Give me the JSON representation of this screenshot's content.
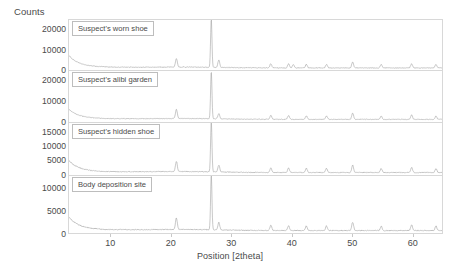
{
  "chart_data": {
    "type": "line",
    "title": "",
    "subtitle": "",
    "xlabel": "Position [2theta]",
    "ylabel": "Counts",
    "xlim": [
      3,
      65
    ],
    "grid": false,
    "legend_position": "in-panel-box",
    "xticks": [
      10,
      20,
      30,
      40,
      50,
      60
    ],
    "xtick_labels": [
      "10",
      "20",
      "30",
      "40",
      "50",
      "60"
    ],
    "panels": [
      {
        "label": "Suspect's worn shoe",
        "ylim": [
          0,
          25000
        ],
        "yticks": [
          0,
          10000,
          20000
        ],
        "ytick_labels": [
          "0",
          "10000",
          "20000"
        ],
        "peaks": [
          {
            "x": 20.85,
            "y": 4200
          },
          {
            "x": 26.65,
            "y": 24000
          },
          {
            "x": 27.9,
            "y": 3600
          },
          {
            "x": 36.55,
            "y": 2100
          },
          {
            "x": 39.5,
            "y": 2000
          },
          {
            "x": 40.3,
            "y": 1700
          },
          {
            "x": 42.45,
            "y": 1800
          },
          {
            "x": 45.8,
            "y": 1800
          },
          {
            "x": 50.15,
            "y": 3000
          },
          {
            "x": 54.9,
            "y": 1700
          },
          {
            "x": 59.95,
            "y": 2100
          },
          {
            "x": 64.0,
            "y": 1700
          }
        ],
        "baseline": 1100,
        "low_angle_rise": 5200
      },
      {
        "label": "Suspect's alibi garden",
        "ylim": [
          0,
          25000
        ],
        "yticks": [
          0,
          10000,
          20000
        ],
        "ytick_labels": [
          "0",
          "10000",
          "20000"
        ],
        "peaks": [
          {
            "x": 20.85,
            "y": 4500
          },
          {
            "x": 26.65,
            "y": 23500
          },
          {
            "x": 27.9,
            "y": 2600
          },
          {
            "x": 36.55,
            "y": 2000
          },
          {
            "x": 39.5,
            "y": 1900
          },
          {
            "x": 42.45,
            "y": 1700
          },
          {
            "x": 45.8,
            "y": 1700
          },
          {
            "x": 50.15,
            "y": 3200
          },
          {
            "x": 54.9,
            "y": 1600
          },
          {
            "x": 59.95,
            "y": 2200
          },
          {
            "x": 64.0,
            "y": 1600
          }
        ],
        "baseline": 1000,
        "low_angle_rise": 4200
      },
      {
        "label": "Suspect's hidden shoe",
        "ylim": [
          0,
          18500
        ],
        "yticks": [
          0,
          5000,
          10000,
          15000
        ],
        "ytick_labels": [
          "0",
          "5000",
          "10000",
          "15000"
        ],
        "peaks": [
          {
            "x": 20.85,
            "y": 3600
          },
          {
            "x": 26.65,
            "y": 17800
          },
          {
            "x": 27.9,
            "y": 2400
          },
          {
            "x": 36.55,
            "y": 1700
          },
          {
            "x": 39.5,
            "y": 1600
          },
          {
            "x": 42.45,
            "y": 1500
          },
          {
            "x": 45.8,
            "y": 1500
          },
          {
            "x": 50.15,
            "y": 2600
          },
          {
            "x": 54.9,
            "y": 1400
          },
          {
            "x": 59.95,
            "y": 1800
          },
          {
            "x": 64.0,
            "y": 1400
          }
        ],
        "baseline": 900,
        "low_angle_rise": 3600
      },
      {
        "label": "Body deposition site",
        "ylim": [
          0,
          13000
        ],
        "yticks": [
          0,
          5000,
          10000
        ],
        "ytick_labels": [
          "0",
          "5000",
          "10000"
        ],
        "peaks": [
          {
            "x": 20.85,
            "y": 2600
          },
          {
            "x": 26.65,
            "y": 12500
          },
          {
            "x": 27.9,
            "y": 1700
          },
          {
            "x": 36.55,
            "y": 1200
          },
          {
            "x": 39.5,
            "y": 1100
          },
          {
            "x": 42.45,
            "y": 1050
          },
          {
            "x": 45.8,
            "y": 1050
          },
          {
            "x": 50.15,
            "y": 1900
          },
          {
            "x": 54.9,
            "y": 1000
          },
          {
            "x": 59.95,
            "y": 1300
          },
          {
            "x": 64.0,
            "y": 1000
          }
        ],
        "baseline": 620,
        "low_angle_rise": 2600
      }
    ]
  }
}
